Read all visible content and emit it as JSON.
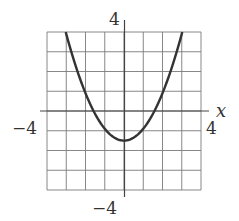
{
  "chart_data": {
    "type": "line",
    "title": "",
    "xlabel": "x",
    "ylabel": "",
    "xlim": [
      -4,
      4
    ],
    "ylim": [
      -4,
      4
    ],
    "grid": true,
    "grid_step": 1,
    "tick_labels": {
      "x_min": "−4",
      "x_max": "4",
      "y_min": "−4",
      "y_max": "4"
    },
    "series": [
      {
        "name": "parabola",
        "equation_estimate": "y = 0.6x^2 - 1.5",
        "vertex": [
          0,
          -1.5
        ],
        "x_intercepts": [
          -1.58,
          1.58
        ],
        "x": [
          -3.1,
          -3,
          -2.5,
          -2,
          -1.5,
          -1,
          -0.5,
          0,
          0.5,
          1,
          1.5,
          2,
          2.5,
          3,
          3.1
        ],
        "values": [
          4.27,
          3.9,
          2.25,
          0.9,
          -0.15,
          -0.9,
          -1.35,
          -1.5,
          -1.35,
          -0.9,
          -0.15,
          0.9,
          2.25,
          3.9,
          4.27
        ]
      }
    ],
    "legend": null
  },
  "labels": {
    "y_top": "4",
    "y_bottom": "−4",
    "x_left": "−4",
    "x_right": "4",
    "x_axis_name": "x"
  },
  "colors": {
    "grid": "#7a7a7a",
    "axis": "#444444",
    "curve": "#333333",
    "text": "#333333"
  }
}
